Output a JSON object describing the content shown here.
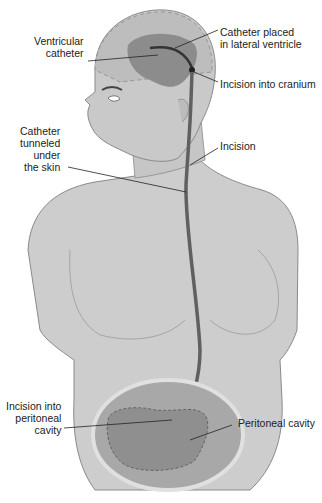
{
  "diagram": {
    "labels": {
      "ventricular_catheter": "Ventricular\ncatheter",
      "catheter_lateral_ventricle": "Catheter placed\nin lateral ventricle",
      "incision_cranium": "Incision into cranium",
      "catheter_tunneled": "Catheter\ntunneled\nunder\nthe skin",
      "incision_neck": "Incision",
      "incision_peritoneal": "Incision into\nperitoneal\ncavity",
      "peritoneal_cavity": "Peritoneal cavity"
    },
    "colors": {
      "skin": "#c9c9c9",
      "skin_outline": "#8a8a8a",
      "brain": "#8c8c8c",
      "catheter": "#5e5e5e",
      "cavity_outer": "#a8a8a8",
      "cavity_inner": "#8f8f8f",
      "leader_line": "#222222"
    }
  }
}
